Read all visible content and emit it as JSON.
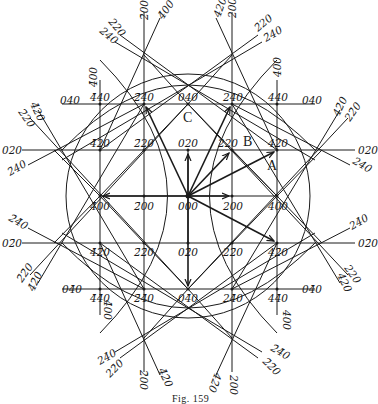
{
  "figure": {
    "caption": "Fig. 159",
    "center_label": "000",
    "point_markers": {
      "A": "A",
      "B": "B",
      "C": "C"
    }
  },
  "lattice_labels": {
    "r4": [
      "4̄40",
      "2̄40",
      "040",
      "240",
      "440"
    ],
    "r2": [
      "4̄20",
      "2̄20",
      "020",
      "220",
      "420"
    ],
    "r0": [
      "4̄00",
      "2̄00",
      "000",
      "200",
      "400"
    ],
    "rm2": [
      "4̄2̄0",
      "2̄2̄0",
      "02̄0",
      "22̄0",
      "42̄0"
    ],
    "rm4": [
      "4̄4̄0",
      "2̄4̄0",
      "04̄0",
      "24̄0",
      "44̄0"
    ]
  },
  "line_labels": {
    "top_left": [
      "2̄00",
      "4̄00",
      "220",
      "240"
    ],
    "top_right": [
      "420",
      "200",
      "2̄20",
      "2̄40"
    ],
    "left_upper": [
      "040",
      "4̄20",
      "2̄20",
      "020",
      "2̄40"
    ],
    "right_upper": [
      "040",
      "42̄0",
      "22̄0",
      "020",
      "240"
    ],
    "left_lower": [
      "2̄4̄0",
      "02̄0",
      "2̄2̄0",
      "4̄2̄0",
      "04̄0"
    ],
    "right_lower": [
      "24̄0",
      "02̄0",
      "220",
      "420",
      "04̄0"
    ],
    "bottom_left": [
      "24̄0",
      "22̄0",
      "2̄00",
      "4̄2̄0"
    ],
    "bottom_right": [
      "2̄4̄0",
      "2̄2̄0",
      "200",
      "42̄0"
    ],
    "vertical_stubs": [
      "4̄00",
      "400",
      "4̄00",
      "400"
    ]
  },
  "vectors_from_origin": [
    "2̄40",
    "240",
    "220",
    "420",
    "020",
    "200",
    "4̄00",
    "42̄0",
    "04̄0"
  ]
}
